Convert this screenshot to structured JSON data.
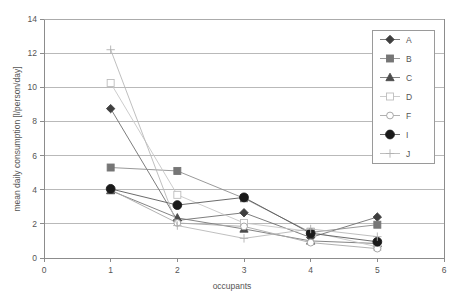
{
  "chart_data": {
    "type": "line",
    "title": "",
    "xlabel": "occupants",
    "ylabel": "mean daily consumption [l/person/day]",
    "x": [
      1,
      2,
      3,
      4,
      5
    ],
    "xlim": [
      0,
      6
    ],
    "ylim": [
      0,
      14
    ],
    "xticks": [
      0,
      1,
      2,
      3,
      4,
      5,
      6
    ],
    "yticks": [
      0,
      2,
      4,
      6,
      8,
      10,
      12,
      14
    ],
    "xtick_labels": [
      "0",
      "1",
      "2",
      "3",
      "4",
      "5",
      "6"
    ],
    "ytick_labels": [
      "0",
      "2",
      "4",
      "6",
      "8",
      "10",
      "12",
      "14"
    ],
    "grid": "horizontal",
    "legend_position": "right-top",
    "series": [
      {
        "name": "A",
        "marker": "filled-diamond",
        "color": "#3f3f3f",
        "line_color": "#6e6e6e",
        "values": [
          8.75,
          2.2,
          2.65,
          1.2,
          2.4
        ]
      },
      {
        "name": "B",
        "marker": "filled-square",
        "color": "#767676",
        "line_color": "#8d8d8d",
        "values": [
          5.3,
          5.1,
          3.5,
          1.5,
          1.95
        ]
      },
      {
        "name": "C",
        "marker": "filled-triangle",
        "color": "#4c4c4c",
        "line_color": "#767676",
        "values": [
          3.95,
          2.35,
          1.7,
          1.0,
          0.85
        ]
      },
      {
        "name": "D",
        "marker": "open-square",
        "color": "#bdbdbd",
        "line_color": "#c6c6c6",
        "values": [
          10.25,
          3.7,
          2.05,
          1.55,
          0.65
        ]
      },
      {
        "name": "F",
        "marker": "open-circle",
        "color": "#9e9e9e",
        "line_color": "#a8a8a8",
        "values": [
          4.0,
          2.05,
          1.85,
          0.9,
          0.55
        ]
      },
      {
        "name": "I",
        "marker": "large-filled-circle",
        "color": "#1a1a1a",
        "line_color": "#5a5a5a",
        "values": [
          4.05,
          3.1,
          3.55,
          1.45,
          0.95
        ]
      },
      {
        "name": "J",
        "marker": "plus",
        "color": "#b0b0b0",
        "line_color": "#b8b8b8",
        "values": [
          12.2,
          1.9,
          1.15,
          1.7,
          1.25
        ]
      }
    ]
  },
  "legend": {
    "entries": [
      "A",
      "B",
      "C",
      "D",
      "F",
      "I",
      "J"
    ]
  },
  "colors": {
    "axis": "#8c8c8c",
    "grid": "#a8a8a8",
    "text": "#555555",
    "background": "#ffffff"
  }
}
